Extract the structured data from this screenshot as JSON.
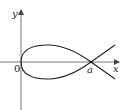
{
  "diagram": {
    "type": "curve-plot",
    "axes": {
      "x_label": "x",
      "y_label": "y",
      "origin_label": "0"
    },
    "annotations": {
      "node_label": "a"
    },
    "colors": {
      "axis": "#555555",
      "curve": "#222222",
      "background": "#ffffff"
    }
  }
}
